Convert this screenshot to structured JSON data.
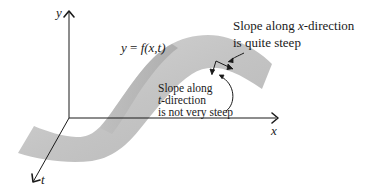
{
  "diagram": {
    "axes": {
      "y_label": "y",
      "x_label": "x",
      "t_label": "t"
    },
    "function_label": {
      "lhs": "y",
      "eq": " = ",
      "rhs_f": "f",
      "rhs_args": "(x,t)"
    },
    "annotation_x_direction": {
      "line1_prefix": "Slope along ",
      "line1_var": "x",
      "line1_suffix": "-direction",
      "line2": "is quite steep"
    },
    "annotation_t_direction": {
      "line1": "Slope along",
      "line2_var": "t",
      "line2_suffix": "-direction",
      "line3": "is not very steep"
    },
    "colors": {
      "surface": "#c8c8c8",
      "surface_dark": "#a9a9a9",
      "ink": "#1a1a1a",
      "background": "#ffffff"
    }
  }
}
